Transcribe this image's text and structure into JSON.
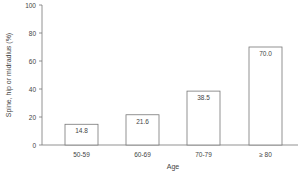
{
  "chart_data": {
    "type": "bar",
    "title": "",
    "xlabel": "Age",
    "ylabel": "Spine, hip or midradius (%)",
    "categories": [
      "50-59",
      "60-69",
      "70-79",
      "≥ 80"
    ],
    "values": [
      14.8,
      21.6,
      38.5,
      70.0
    ],
    "value_labels": [
      "14.8",
      "21.6",
      "38.5",
      "70.0"
    ],
    "ylim": [
      0,
      100
    ],
    "yticks": [
      0,
      20,
      40,
      60,
      80,
      100
    ],
    "grid": false,
    "legend": null
  },
  "colors": {
    "bar_fill": "#ffffff",
    "bar_stroke": "#777777",
    "axis": "#777777",
    "text": "#444444"
  }
}
